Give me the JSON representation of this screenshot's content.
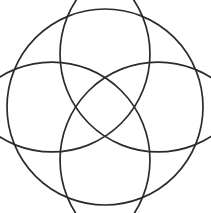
{
  "figure": {
    "title": "Geometric Rosette",
    "background_color": "#ffffff",
    "stroke_color": "#2b2b2b",
    "stroke_width": 1.7,
    "canvas": {
      "width": 211,
      "height": 213
    },
    "geometry": {
      "center_x": 105,
      "center_y": 107,
      "outer_radius": 98,
      "petal_radius": 98,
      "petal_center_offset": 75,
      "petal_count": 4,
      "cusp_count": 8,
      "cusp_angle_step_degrees": 45,
      "start_angle_degrees": 45
    },
    "circles": [
      {
        "name": "outer-boundary-circle",
        "cx": 105,
        "cy": 107,
        "r": 98
      },
      {
        "name": "petal-circle-ne",
        "cx": 158.03,
        "cy": 53.97,
        "r": 98
      },
      {
        "name": "petal-circle-nw",
        "cx": 51.97,
        "cy": 53.97,
        "r": 98
      },
      {
        "name": "petal-circle-sw",
        "cx": 51.97,
        "cy": 160.03,
        "r": 98
      },
      {
        "name": "petal-circle-se",
        "cx": 158.03,
        "cy": 160.03,
        "r": 98
      }
    ],
    "cusp_points": [
      {
        "name": "cusp-top",
        "x": 105,
        "y": 9
      },
      {
        "name": "cusp-top-right",
        "x": 174.3,
        "y": 37.7
      },
      {
        "name": "cusp-right",
        "x": 203,
        "y": 107
      },
      {
        "name": "cusp-bottom-right",
        "x": 174.3,
        "y": 176.3
      },
      {
        "name": "cusp-bottom",
        "x": 105,
        "y": 205
      },
      {
        "name": "cusp-bottom-left",
        "x": 35.7,
        "y": 176.3
      },
      {
        "name": "cusp-left",
        "x": 7,
        "y": 107
      },
      {
        "name": "cusp-top-left",
        "x": 35.7,
        "y": 37.7
      }
    ]
  }
}
